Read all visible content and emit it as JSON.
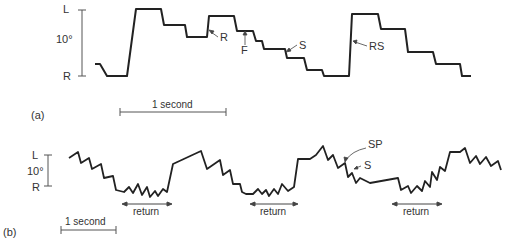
{
  "panel_a": {
    "label": "(a)",
    "scale": {
      "top": "L",
      "middle": "10°",
      "bottom": "R"
    },
    "time_bar": "1 second",
    "annotations": {
      "r": "R",
      "f": "F",
      "s": "S",
      "rs": "RS"
    }
  },
  "panel_b": {
    "label": "(b)",
    "scale": {
      "top": "L",
      "middle": "10°",
      "bottom": "R"
    },
    "time_bar": "1 second",
    "annotations": {
      "sp": "SP",
      "s": "S"
    },
    "returns": [
      "return",
      "return",
      "return"
    ]
  },
  "colors": {
    "trace": "#222222",
    "annotation": "#444444"
  }
}
